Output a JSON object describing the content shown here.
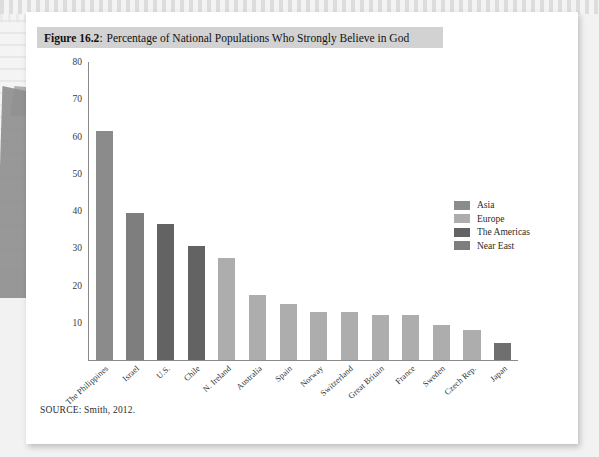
{
  "figure": {
    "number": "Figure 16.2",
    "colon": ":",
    "title": "Percentage of National Populations Who Strongly Believe in God",
    "source": "SOURCE: Smith, 2012."
  },
  "palette": {
    "asia": "#8b8b8b",
    "europe": "#adadad",
    "americas": "#636363",
    "near_east": "#7e7e7e",
    "axis": "#8a8a8a",
    "caption_bg": "#d2d2d2",
    "page_bg": "#ffffff",
    "scan_bg": "#f2f2f2"
  },
  "legend": {
    "position": "right",
    "items": [
      {
        "label": "Asia",
        "color": "#8b8b8b"
      },
      {
        "label": "Europe",
        "color": "#adadad"
      },
      {
        "label": "The Americas",
        "color": "#636363"
      },
      {
        "label": "Near East",
        "color": "#7e7e7e"
      }
    ]
  },
  "chart_data": {
    "type": "bar",
    "title": "Percentage of National Populations Who Strongly Believe in God",
    "xlabel": "",
    "ylabel": "",
    "ylim": [
      0,
      80
    ],
    "yticks": [
      80,
      70,
      60,
      50,
      40,
      30,
      20,
      10
    ],
    "grid": false,
    "categories": [
      "The Philippines",
      "Israel",
      "U.S.",
      "Chile",
      "N. Ireland",
      "Australia",
      "Spain",
      "Norway",
      "Switzerland",
      "Great Britain",
      "France",
      "Sweden",
      "Czech Rep.",
      "Japan"
    ],
    "values": [
      61.5,
      39.5,
      36.5,
      30.5,
      27.5,
      17.5,
      15,
      13,
      13,
      12,
      12,
      9.5,
      8,
      4.5
    ],
    "group": [
      "Asia",
      "Near East",
      "The Americas",
      "The Americas",
      "Europe",
      "Europe",
      "Europe",
      "Europe",
      "Europe",
      "Europe",
      "Europe",
      "Europe",
      "Europe",
      "Asia"
    ],
    "bar_colors": [
      "#8b8b8b",
      "#7e7e7e",
      "#636363",
      "#636363",
      "#adadad",
      "#adadad",
      "#adadad",
      "#adadad",
      "#adadad",
      "#adadad",
      "#adadad",
      "#adadad",
      "#adadad",
      "#6f6f6f"
    ]
  }
}
